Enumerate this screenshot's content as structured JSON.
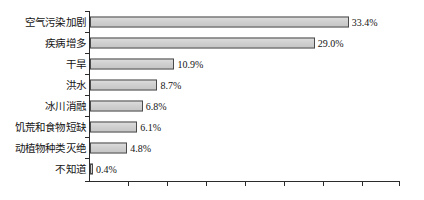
{
  "chart_data": {
    "type": "bar",
    "orientation": "horizontal",
    "title": "",
    "subtitle": "",
    "xlabel": "",
    "ylabel": "",
    "categories": [
      "空气污染加剧",
      "疾病增多",
      "干旱",
      "洪水",
      "冰川消融",
      "饥荒和食物短缺",
      "动植物种类灭绝",
      "不知道"
    ],
    "values": [
      33.4,
      29.0,
      10.9,
      8.7,
      6.8,
      6.1,
      4.8,
      0.4
    ],
    "value_labels": [
      "33.4%",
      "29.0%",
      "10.9%",
      "8.7%",
      "6.8%",
      "6.1%",
      "4.8%",
      "0.4%"
    ],
    "unit": "%",
    "xlim": [
      0,
      40
    ],
    "xticks": [
      0,
      5,
      10,
      15,
      20,
      25,
      30,
      35,
      40
    ],
    "xtick_labels": [
      "",
      "",
      "",
      "",
      "",
      "",
      "",
      "",
      ""
    ],
    "grid": false,
    "legend": false,
    "legend_position": "none",
    "series": [
      {
        "name": "",
        "values": [
          33.4,
          29.0,
          10.9,
          8.7,
          6.8,
          6.1,
          4.8,
          0.4
        ]
      }
    ],
    "annotations": []
  },
  "style": {
    "bar_fill": "#d2d2d2",
    "bar_border": "#4a4a4a",
    "axis_color": "#2b2b2b",
    "text_color": "#141414",
    "background": "#ffffff"
  }
}
